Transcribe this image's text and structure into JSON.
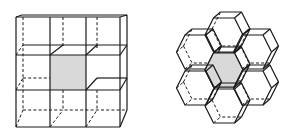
{
  "figure": {
    "colors": {
      "line": "#1a1a1a",
      "highlight_fill": "#d9d9d9",
      "background": "#ffffff"
    },
    "panels": [
      {
        "name": "cube-grid",
        "cell_shape": "cube",
        "layout": "3x3",
        "highlighted_cell": "center"
      },
      {
        "name": "hexagonal-prism-cluster",
        "cell_shape": "hexagonal-prism",
        "layout": "1 center + 6 neighbors",
        "highlighted_cell": "center"
      }
    ]
  }
}
